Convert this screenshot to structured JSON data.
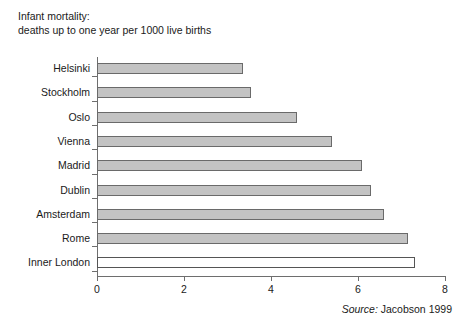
{
  "title": {
    "line1": "Infant mortality:",
    "line2": "deaths up to one year per 1000 live births"
  },
  "source": {
    "label": "Source:",
    "value": "Jacobson 1999"
  },
  "style": {
    "bar_fill": "#c3c3c3",
    "bar_border": "#6a6a6a",
    "highlight_fill": "#ffffff",
    "axis_color": "#6e6e6e",
    "text_color": "#1a1a1a"
  },
  "chart_data": {
    "type": "bar",
    "orientation": "horizontal",
    "title": "Infant mortality: deaths up to one year per 1000 live births",
    "xlabel": "",
    "ylabel": "",
    "xlim": [
      0,
      8
    ],
    "xticks": [
      0,
      2,
      4,
      6,
      8
    ],
    "grid": false,
    "legend": "none",
    "categories": [
      "Helsinki",
      "Stockholm",
      "Oslo",
      "Vienna",
      "Madrid",
      "Dublin",
      "Amsterdam",
      "Rome",
      "Inner London"
    ],
    "values": [
      3.35,
      3.55,
      4.6,
      5.4,
      6.1,
      6.3,
      6.6,
      7.15,
      7.3
    ],
    "highlight_category": "Inner London"
  }
}
